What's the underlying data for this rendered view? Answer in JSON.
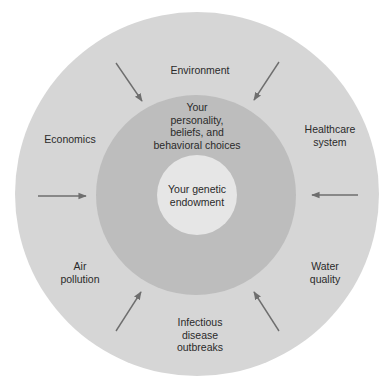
{
  "diagram": {
    "type": "concentric-circles",
    "colors": {
      "background": "#ffffff",
      "outer_ring": "#d6d6d6",
      "middle_ring": "#bdbdbd",
      "inner_core": "#e6e6e6",
      "arrow": "#6e6e6e",
      "text": "#2a2a2a"
    },
    "core": {
      "label": "Your genetic\nendowment"
    },
    "middle": {
      "label": "Your\npersonality,\nbeliefs, and\nbehavioral choices"
    },
    "outer_factors": [
      {
        "id": "environment",
        "label": "Environment"
      },
      {
        "id": "healthcare",
        "label": "Healthcare\nsystem"
      },
      {
        "id": "water",
        "label": "Water\nquality"
      },
      {
        "id": "infectious",
        "label": "Infectious\ndisease\noutbreaks"
      },
      {
        "id": "air",
        "label": "Air\npollution"
      },
      {
        "id": "economics",
        "label": "Economics"
      }
    ],
    "arrows": [
      {
        "id": "top-left",
        "direction": "inward"
      },
      {
        "id": "top-right",
        "direction": "inward"
      },
      {
        "id": "left",
        "direction": "inward"
      },
      {
        "id": "right",
        "direction": "inward"
      },
      {
        "id": "bottom-left",
        "direction": "inward"
      },
      {
        "id": "bottom-right",
        "direction": "inward"
      }
    ]
  }
}
